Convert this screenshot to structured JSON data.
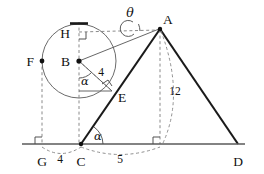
{
  "figure": {
    "kind": "geometry-diagram",
    "background_color": "#ffffff",
    "ink_color": "#111111",
    "thick_stroke_color": "#1a1a1a",
    "thin_stroke_color": "#555555",
    "circle_stroke_color": "#6b6b6b",
    "dashed_stroke_color": "#8a8a8a",
    "baseline_color": "#5a5a5a"
  },
  "points": {
    "A": {
      "label": "A",
      "x": 160,
      "y": 28,
      "label_x": 163,
      "label_y": 24,
      "dot": true
    },
    "B": {
      "label": "B",
      "x": 79,
      "y": 61,
      "label_x": 68,
      "label_y": 65,
      "dot": true
    },
    "C": {
      "label": "C",
      "x": 81,
      "y": 144,
      "label_x": 78,
      "label_y": 160,
      "dot": true
    },
    "D": {
      "label": "D",
      "x": 238,
      "y": 144,
      "label_x": 235,
      "label_y": 160,
      "dot": false
    },
    "E": {
      "label": "E",
      "x": 112,
      "y": 91,
      "label_x": 117,
      "label_y": 99,
      "dot": false
    },
    "F": {
      "label": "F",
      "x": 42,
      "y": 61,
      "label_x": 25,
      "label_y": 65,
      "dot": true
    },
    "G": {
      "label": "G",
      "x": 42,
      "y": 144,
      "label_x": 29,
      "label_y": 160,
      "dot": false
    },
    "H": {
      "label": "H",
      "x": 79,
      "y": 32,
      "label_x": 61,
      "label_y": 36,
      "dot": false
    },
    "M": {
      "label": "",
      "x": 160,
      "y": 144,
      "label_x": 160,
      "label_y": 144,
      "dot": false
    }
  },
  "circle": {
    "center_x": 79,
    "center_y": 61,
    "radius": 37
  },
  "labels": {
    "A": "A",
    "B": "B",
    "C": "C",
    "D": "D",
    "E": "E",
    "F": "F",
    "G": "G",
    "H": "H"
  },
  "measurements": {
    "radius_BE": {
      "text": "4",
      "x": 99,
      "y": 72
    },
    "altitude_A": {
      "text": "12",
      "x": 172,
      "y": 92
    },
    "base_GC": {
      "text": "4",
      "x": 60,
      "y": 161
    },
    "base_CM": {
      "text": "5",
      "x": 120,
      "y": 161
    }
  },
  "angles": {
    "theta_at_A": {
      "text": "θ",
      "x": 130,
      "y": 16
    },
    "alpha_at_B": {
      "text": "α",
      "x": 84,
      "y": 83
    },
    "alpha_at_C": {
      "text": "α",
      "x": 96,
      "y": 139
    }
  },
  "geometry_facts": {
    "tangent_point": "E",
    "tangent_line": "C-A",
    "circle_center": "B",
    "radius_length": 4,
    "triangle_altitude": 12,
    "segment_G_to_C": 4,
    "segment_C_to_foot": 5,
    "right_angles_at": [
      "E",
      "G",
      "H",
      "foot-of-altitude"
    ]
  }
}
